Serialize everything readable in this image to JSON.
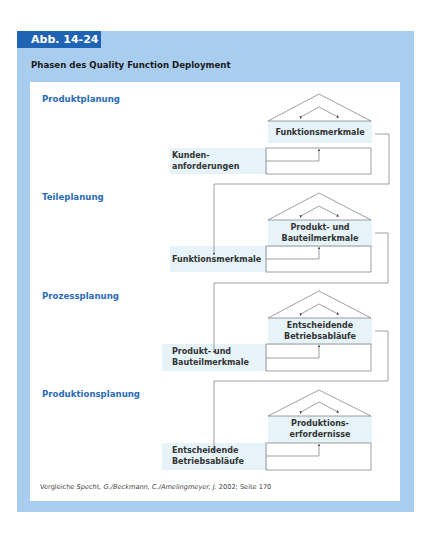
{
  "figure": {
    "number_label": "Abb. 14-24",
    "title": "Phasen des Quality Function Deployment",
    "source": {
      "prefix": "Vergleiche ",
      "authors": "Specht, G./Beckmann, C./Amelingmeyer, J.",
      "suffix": " 2002; Seite 170"
    }
  },
  "stages": [
    {
      "name": "Produktplanung",
      "input": "Kunden-\nanforderungen",
      "input_lines": [
        "Kunden-",
        "anforderungen"
      ],
      "output_lines": [
        "Funktionsmerkmale"
      ]
    },
    {
      "name": "Teileplanung",
      "input_lines": [
        "Funktionsmerkmale"
      ],
      "output_lines": [
        "Produkt- und",
        "Bauteilmerkmale"
      ]
    },
    {
      "name": "Prozessplanung",
      "input_lines": [
        "Produkt- und",
        "Bauteilmerkmale"
      ],
      "output_lines": [
        "Entscheidende",
        "Betriebsabläufe"
      ]
    },
    {
      "name": "Produktionsplanung",
      "input_lines": [
        "Entscheidende",
        "Betriebsabläufe"
      ],
      "output_lines": [
        "Produktions-",
        "erfordernisse"
      ]
    }
  ],
  "colors": {
    "panel": "#a9cdee",
    "tab": "#1f63b4",
    "stage_label": "#2a6cb8",
    "band": "#e6f3f9",
    "line": "#666666"
  }
}
